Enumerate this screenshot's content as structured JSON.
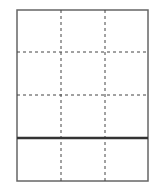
{
  "diagram": {
    "type": "grid",
    "columns": 3,
    "rows": 4,
    "frame": {
      "x": 17,
      "y": 10,
      "width": 131,
      "height": 171,
      "color": "#666666",
      "stroke_width": 1.5
    },
    "vertical_dashed_lines_x": [
      61,
      105
    ],
    "horizontal_dashed_lines_y": [
      52,
      95
    ],
    "solid_separator": {
      "y": 138,
      "color": "#333333",
      "stroke_width": 2.5
    },
    "dash_color": "#444444",
    "dash_pattern": "3,3"
  }
}
